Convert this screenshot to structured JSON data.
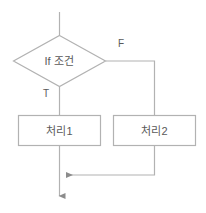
{
  "diagram": {
    "type": "flowchart",
    "colors": {
      "stroke": "#b2b2b2",
      "text": "#5a5a5a",
      "background": "#ffffff",
      "arrowhead": "#8c8c8c"
    },
    "nodes": [
      {
        "id": "entry",
        "shape": "line",
        "label": ""
      },
      {
        "id": "condition",
        "shape": "diamond",
        "label": "If 조건"
      },
      {
        "id": "process-1",
        "shape": "rectangle",
        "label": "처리1"
      },
      {
        "id": "process-2",
        "shape": "rectangle",
        "label": "처리2"
      }
    ],
    "edges": [
      {
        "id": "edge-true",
        "from": "condition",
        "to": "process-1",
        "label": "T"
      },
      {
        "id": "edge-false",
        "from": "condition",
        "to": "process-2",
        "label": "F"
      },
      {
        "id": "edge-merge-left",
        "from": "process-1",
        "to": "exit",
        "label": ""
      },
      {
        "id": "edge-merge-right",
        "from": "process-2",
        "to": "exit",
        "label": ""
      }
    ]
  }
}
